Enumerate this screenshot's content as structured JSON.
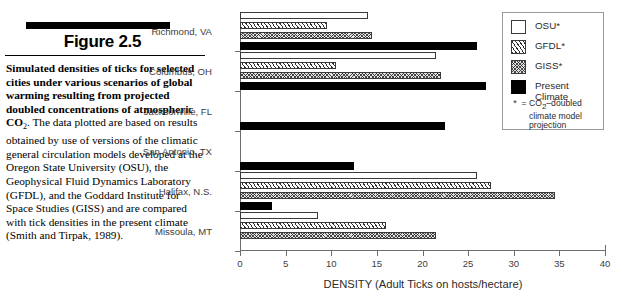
{
  "caption": {
    "figure_title": "Figure 2.5",
    "lead": "Simulated densities of ticks for selected cities under various scenarios of global warming resulting from projected doubled concentrations of atmospheric CO",
    "lead_sub": "2",
    "body": ". The data plotted are based on results obtained by use of versions of the climatic general circulation models developed at the Oregon State University (OSU), the Geophysical Fluid Dynamics Laboratory (GFDL), and the Goddard Institute for Space Studies (GISS) and are compared with tick densities in the present climate (Smith and Tirpak, 1989)."
  },
  "legend": {
    "items": [
      {
        "label": "OSU*",
        "swatch": "white-square"
      },
      {
        "label": "GFDL*",
        "swatch": "diagonal-hatch-square"
      },
      {
        "label": "GISS*",
        "swatch": "cross-hatch-square"
      },
      {
        "label": "Present\nClimate",
        "swatch": "black-square"
      }
    ],
    "note_star": "*",
    "note_equals": "=",
    "note_text_pre": "CO",
    "note_text_sub": "2",
    "note_text_post": "–doubled\nclimate model\nprojection"
  },
  "chart_data": {
    "type": "bar",
    "orientation": "horizontal",
    "title": "",
    "xlabel": "DENSITY (Adult Ticks on hosts/hectare)",
    "ylabel": "",
    "xlim": [
      0,
      40
    ],
    "xticks": [
      0,
      5,
      10,
      15,
      20,
      25,
      30,
      35,
      40
    ],
    "xticklabels": [
      "0",
      "5",
      "10",
      "15",
      "20",
      "25",
      "30",
      "35",
      "40"
    ],
    "grid": false,
    "legend_position": "top-right",
    "categories": [
      "Richmond, VA",
      "Columbus, OH",
      "Jacksonville, FL",
      "San Antonio, TX",
      "Halifax, N.S.",
      "Missoula, MT"
    ],
    "series": [
      {
        "name": "OSU*",
        "values": [
          14.0,
          21.5,
          0,
          0,
          26.0,
          8.5
        ]
      },
      {
        "name": "GFDL*",
        "values": [
          9.5,
          10.5,
          0,
          0,
          27.5,
          16.0
        ]
      },
      {
        "name": "GISS*",
        "values": [
          14.5,
          22.0,
          0,
          0,
          34.5,
          21.5
        ]
      },
      {
        "name": "Present Climate",
        "values": [
          26.0,
          27.0,
          22.5,
          12.5,
          3.5,
          0
        ]
      }
    ]
  },
  "colors": {
    "osu": "#ffffff",
    "gfdl": "#ffffff",
    "giss": "#e2e2e2",
    "present": "#000000",
    "axis": "#6d6d6d",
    "text": "#2b2b2b"
  }
}
